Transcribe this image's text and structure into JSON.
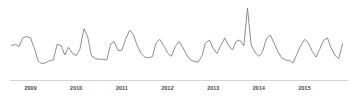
{
  "chart_data": {
    "type": "line",
    "title": "",
    "subtitle": "",
    "xlabel": "",
    "ylabel": "",
    "grid": false,
    "legend": null,
    "legend_position": "none",
    "series_color": "#808080",
    "axis_color": "#d4d4d4",
    "label_color": "#3d3d3d",
    "background": "#ffffff",
    "xlim": [
      2008.55,
      2015.95
    ],
    "ylim": [
      0,
      100
    ],
    "tick_labels": [
      "2009",
      "2010",
      "2011",
      "2012",
      "2013",
      "2014",
      "2015"
    ],
    "tick_values": [
      2009,
      2010,
      2011,
      2012,
      2013,
      2014,
      2015
    ],
    "annotations": [
      {
        "label": "outlier spike",
        "x": 2013.45,
        "y": 100
      }
    ],
    "x": [
      2008.58,
      2008.67,
      2008.75,
      2008.83,
      2008.92,
      2009.0,
      2009.08,
      2009.17,
      2009.25,
      2009.33,
      2009.42,
      2009.5,
      2009.58,
      2009.67,
      2009.75,
      2009.83,
      2009.92,
      2010.0,
      2010.08,
      2010.17,
      2010.25,
      2010.33,
      2010.42,
      2010.5,
      2010.58,
      2010.67,
      2010.75,
      2010.83,
      2010.92,
      2011.0,
      2011.08,
      2011.17,
      2011.25,
      2011.33,
      2011.42,
      2011.5,
      2011.58,
      2011.67,
      2011.75,
      2011.83,
      2011.92,
      2012.0,
      2012.08,
      2012.17,
      2012.25,
      2012.33,
      2012.42,
      2012.5,
      2012.58,
      2012.67,
      2012.75,
      2012.83,
      2012.92,
      2013.0,
      2013.08,
      2013.17,
      2013.25,
      2013.33,
      2013.42,
      2013.5,
      2013.58,
      2013.67,
      2013.75,
      2013.83,
      2013.92,
      2014.0,
      2014.08,
      2014.17,
      2014.25,
      2014.33,
      2014.42,
      2014.5,
      2014.58,
      2014.67,
      2014.75,
      2014.83,
      2014.92,
      2015.0,
      2015.08,
      2015.17,
      2015.25,
      2015.33,
      2015.42,
      2015.5,
      2015.58,
      2015.67,
      2015.75,
      2015.83
    ],
    "values": [
      44,
      46,
      43,
      55,
      57,
      55,
      41,
      22,
      19,
      20,
      23,
      24,
      46,
      44,
      31,
      42,
      33,
      30,
      39,
      68,
      57,
      30,
      26,
      25,
      25,
      24,
      46,
      50,
      37,
      38,
      53,
      66,
      60,
      45,
      33,
      28,
      27,
      29,
      48,
      53,
      44,
      34,
      29,
      43,
      50,
      42,
      31,
      24,
      22,
      21,
      29,
      48,
      52,
      40,
      33,
      45,
      55,
      45,
      38,
      50,
      52,
      44,
      97,
      45,
      34,
      29,
      36,
      55,
      59,
      48,
      35,
      27,
      24,
      23,
      20,
      32,
      45,
      53,
      48,
      36,
      28,
      39,
      52,
      55,
      41,
      30,
      26,
      47
    ]
  }
}
